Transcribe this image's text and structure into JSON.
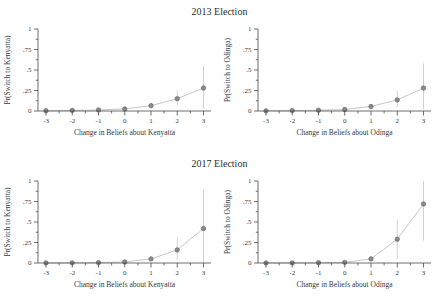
{
  "figure": {
    "sections": [
      {
        "title": "2013 Election"
      },
      {
        "title": "2017 Election"
      }
    ]
  },
  "colors": {
    "background": "#ffffff",
    "text": "#3a3a3a",
    "axis": "#4a4a4a",
    "point_fill": "#8a8a8a",
    "point_stroke": "#696969",
    "line": "#bfbfbf",
    "error_bar": "#cccccc"
  },
  "chart_data": [
    {
      "type": "line",
      "section": "2013 Election",
      "position": "top-left",
      "ylabel": "Pr(Switch to Kenyatta)",
      "xlabel": "Change in Beliefs about Kenyatta",
      "x": [
        -3,
        -2,
        -1,
        0,
        1,
        2,
        3
      ],
      "y": [
        0.003,
        0.007,
        0.013,
        0.025,
        0.065,
        0.15,
        0.28
      ],
      "ci_low": [
        0.001,
        0.003,
        0.006,
        0.014,
        0.04,
        0.07,
        0.03
      ],
      "ci_high": [
        0.007,
        0.013,
        0.024,
        0.042,
        0.1,
        0.25,
        0.55
      ],
      "xtick_labels": [
        "-3",
        "-2",
        "-1",
        "0",
        "1",
        "2",
        "3"
      ],
      "xtick_values": [
        -3,
        -2,
        -1,
        0,
        1,
        2,
        3
      ],
      "xminor_values": [
        -2.5,
        -1.5,
        -0.5,
        0.5,
        1.5,
        2.5
      ],
      "ytick_labels": [
        "0",
        ".25",
        ".5",
        ".75",
        "1"
      ],
      "ytick_values": [
        0,
        0.25,
        0.5,
        0.75,
        1
      ],
      "yminor_values": [
        0.125,
        0.375,
        0.625,
        0.875
      ],
      "ylim": [
        0,
        1
      ],
      "xlim": [
        -3.3,
        3.3
      ],
      "grid": false,
      "legend": null,
      "error_bars": true
    },
    {
      "type": "line",
      "section": "2013 Election",
      "position": "top-right",
      "ylabel": "Pr(Switch to Odinga)",
      "xlabel": "Change in Beliefs about Odinga",
      "x": [
        -3,
        -2,
        -1,
        0,
        1,
        2,
        3
      ],
      "y": [
        0.002,
        0.005,
        0.009,
        0.018,
        0.055,
        0.135,
        0.28
      ],
      "ci_low": [
        0.001,
        0.002,
        0.004,
        0.009,
        0.03,
        0.05,
        0.02
      ],
      "ci_high": [
        0.005,
        0.01,
        0.018,
        0.033,
        0.085,
        0.24,
        0.58
      ],
      "xtick_labels": [
        "-3",
        "-2",
        "-1",
        "0",
        "1",
        "2",
        "3"
      ],
      "xtick_values": [
        -3,
        -2,
        -1,
        0,
        1,
        2,
        3
      ],
      "xminor_values": [
        -2.5,
        -1.5,
        -0.5,
        0.5,
        1.5,
        2.5
      ],
      "ytick_labels": [
        "0",
        ".25",
        ".5",
        ".75",
        "1"
      ],
      "ytick_values": [
        0,
        0.25,
        0.5,
        0.75,
        1
      ],
      "yminor_values": [
        0.125,
        0.375,
        0.625,
        0.875
      ],
      "ylim": [
        0,
        1
      ],
      "xlim": [
        -3.3,
        3.3
      ],
      "grid": false,
      "legend": null,
      "error_bars": true
    },
    {
      "type": "line",
      "section": "2017 Election",
      "position": "bottom-left",
      "ylabel": "Pr(Switch to Kenyatta)",
      "xlabel": "Change in Beliefs about Kenyatta",
      "x": [
        -3,
        -2,
        -1,
        0,
        1,
        2,
        3
      ],
      "y": [
        0.001,
        0.002,
        0.005,
        0.012,
        0.05,
        0.16,
        0.42
      ],
      "ci_low": [
        0.0,
        0.001,
        0.002,
        0.006,
        0.03,
        0.04,
        0.0
      ],
      "ci_high": [
        0.003,
        0.005,
        0.011,
        0.022,
        0.08,
        0.31,
        0.9
      ],
      "xtick_labels": [
        "-3",
        "-2",
        "-1",
        "0",
        "1",
        "2",
        "3"
      ],
      "xtick_values": [
        -3,
        -2,
        -1,
        0,
        1,
        2,
        3
      ],
      "xminor_values": [
        -2.5,
        -1.5,
        -0.5,
        0.5,
        1.5,
        2.5
      ],
      "ytick_labels": [
        "0",
        ".25",
        ".5",
        ".75",
        "1"
      ],
      "ytick_values": [
        0,
        0.25,
        0.5,
        0.75,
        1
      ],
      "yminor_values": [
        0.125,
        0.375,
        0.625,
        0.875
      ],
      "ylim": [
        0,
        1
      ],
      "xlim": [
        -3.3,
        3.3
      ],
      "grid": false,
      "legend": null,
      "error_bars": true
    },
    {
      "type": "line",
      "section": "2017 Election",
      "position": "bottom-right",
      "ylabel": "Pr(Switch to Odinga)",
      "xlabel": "Change in Beliefs about Odinga",
      "x": [
        -3,
        -2,
        -1,
        0,
        1,
        2,
        3
      ],
      "y": [
        0.001,
        0.001,
        0.003,
        0.008,
        0.05,
        0.29,
        0.72
      ],
      "ci_low": [
        0.0,
        0.0,
        0.001,
        0.004,
        0.03,
        0.05,
        0.27
      ],
      "ci_high": [
        0.003,
        0.004,
        0.008,
        0.016,
        0.085,
        0.53,
        1.0
      ],
      "xtick_labels": [
        "-3",
        "-2",
        "-1",
        "0",
        "1",
        "2",
        "3"
      ],
      "xtick_values": [
        -3,
        -2,
        -1,
        0,
        1,
        2,
        3
      ],
      "xminor_values": [
        -2.5,
        -1.5,
        -0.5,
        0.5,
        1.5,
        2.5
      ],
      "ytick_labels": [
        "0",
        ".25",
        ".5",
        ".75",
        "1"
      ],
      "ytick_values": [
        0,
        0.25,
        0.5,
        0.75,
        1
      ],
      "yminor_values": [
        0.125,
        0.375,
        0.625,
        0.875
      ],
      "ylim": [
        0,
        1
      ],
      "xlim": [
        -3.3,
        3.3
      ],
      "grid": false,
      "legend": null,
      "error_bars": true
    }
  ]
}
